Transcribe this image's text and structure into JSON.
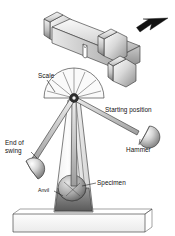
{
  "figure": {
    "type": "technical-diagram",
    "background_color": "#ffffff",
    "line_color": "#3a3a3a",
    "text_color": "#111111",
    "arrow_color": "#111111"
  },
  "labels": {
    "scale": "Scale",
    "starting_position": "Starting position",
    "hammer": "Hammer",
    "end_of_swing_line1": "End of",
    "end_of_swing_line2": "swing",
    "specimen": "Specimen",
    "anvil": "Anvil"
  },
  "parts": {
    "inset_specimen": "notched specimen on anvils",
    "impact_arrow": "strike-direction arrow",
    "pivot": "pendulum pivot",
    "scale_arc": "semicircular measuring scale",
    "column": "tapered support column",
    "base": "machine base block",
    "hammer_start": "hammer at starting position",
    "hammer_end": "hammer at end of swing"
  }
}
